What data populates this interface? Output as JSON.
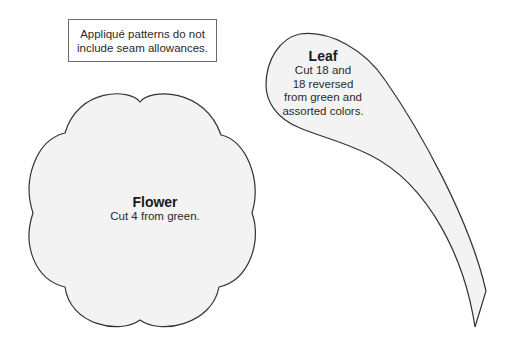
{
  "note": {
    "lines": [
      "Appliqué patterns do not",
      "include seam allowances."
    ]
  },
  "flower": {
    "title": "Flower",
    "instructions": [
      "Cut 4 from green."
    ],
    "lobes": 8
  },
  "leaf": {
    "title": "Leaf",
    "instructions": [
      "Cut 18 and",
      "18 reversed",
      "from green and",
      "assorted colors."
    ]
  },
  "colors": {
    "shape_fill": "#f3f3f3",
    "shape_stroke": "#333333",
    "note_border": "#6b6b6b",
    "text": "#2a2a2a"
  }
}
